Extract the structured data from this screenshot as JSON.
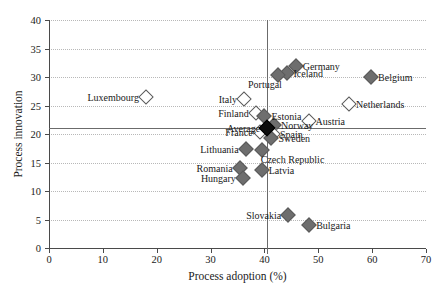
{
  "chart_data": {
    "type": "scatter",
    "title": "",
    "xlabel": "Process adoption (%)",
    "ylabel": "Process innovation",
    "xlim": [
      0,
      70
    ],
    "ylim": [
      0,
      40
    ],
    "xticks": [
      0,
      10,
      20,
      30,
      40,
      50,
      60,
      70
    ],
    "yticks": [
      0,
      5,
      10,
      15,
      20,
      25,
      30,
      35,
      40
    ],
    "grid": "horizontal-dotted",
    "legend": "none",
    "reference_lines": {
      "x": 40.5,
      "y": 21.1
    },
    "points": [
      {
        "name": "Luxembourg",
        "x": 18.0,
        "y": 26.5,
        "marker": "hollow",
        "label_pos": "left"
      },
      {
        "name": "Italy",
        "x": 36.2,
        "y": 26.1,
        "marker": "hollow",
        "label_pos": "left"
      },
      {
        "name": "Finland",
        "x": 38.4,
        "y": 23.6,
        "marker": "hollow",
        "label_pos": "left"
      },
      {
        "name": "Estonia",
        "x": 40.0,
        "y": 23.1,
        "marker": "filled",
        "label_pos": "right"
      },
      {
        "name": "Average",
        "x": 40.5,
        "y": 21.1,
        "marker": "avg",
        "label_pos": "left"
      },
      {
        "name": "France",
        "x": 39.1,
        "y": 20.3,
        "marker": "hollow",
        "label_pos": "left"
      },
      {
        "name": "Austria",
        "x": 48.2,
        "y": 22.2,
        "marker": "hollow",
        "label_pos": "right"
      },
      {
        "name": "Netherlands",
        "x": 55.7,
        "y": 25.3,
        "marker": "hollow",
        "label_pos": "right"
      },
      {
        "name": "Norway",
        "x": 41.8,
        "y": 21.5,
        "marker": "filled",
        "label_pos": "right"
      },
      {
        "name": "Spain",
        "x": 41.6,
        "y": 20.0,
        "marker": "hollow",
        "label_pos": "right"
      },
      {
        "name": "Sweden",
        "x": 41.3,
        "y": 19.3,
        "marker": "filled",
        "label_pos": "right"
      },
      {
        "name": "Germany",
        "x": 45.8,
        "y": 32.0,
        "marker": "filled",
        "label_pos": "right"
      },
      {
        "name": "Iceland",
        "x": 44.1,
        "y": 30.7,
        "marker": "filled",
        "label_pos": "right"
      },
      {
        "name": "Portugal",
        "x": 42.5,
        "y": 30.3,
        "marker": "filled",
        "label_pos": "below-left"
      },
      {
        "name": "Belgium",
        "x": 59.8,
        "y": 30.0,
        "marker": "filled",
        "label_pos": "right"
      },
      {
        "name": "Lithuania",
        "x": 36.5,
        "y": 17.4,
        "marker": "filled",
        "label_pos": "left"
      },
      {
        "name": "Czech Republic",
        "x": 39.5,
        "y": 17.2,
        "marker": "filled",
        "label_pos": "below-right"
      },
      {
        "name": "Romania",
        "x": 35.4,
        "y": 14.0,
        "marker": "filled",
        "label_pos": "left"
      },
      {
        "name": "Latvia",
        "x": 39.5,
        "y": 13.7,
        "marker": "filled",
        "label_pos": "right"
      },
      {
        "name": "Hungary",
        "x": 36.0,
        "y": 12.3,
        "marker": "filled",
        "label_pos": "left"
      },
      {
        "name": "Slovakia",
        "x": 44.4,
        "y": 5.8,
        "marker": "filled",
        "label_pos": "left"
      },
      {
        "name": "Bulgaria",
        "x": 48.3,
        "y": 4.0,
        "marker": "filled",
        "label_pos": "right"
      }
    ]
  },
  "axes": {
    "x_title": "Process adoption (%)",
    "y_title": "Process innovation"
  },
  "colors": {
    "marker_fill": "#6e6e6e",
    "marker_edge": "#5a5a5a",
    "average_fill": "#0d0d0d",
    "axis": "#4a4a4a",
    "grid": "#b8b8b8",
    "reference_line": "#6b6b6b",
    "background": "#ffffff",
    "text": "#1a1a1a"
  }
}
